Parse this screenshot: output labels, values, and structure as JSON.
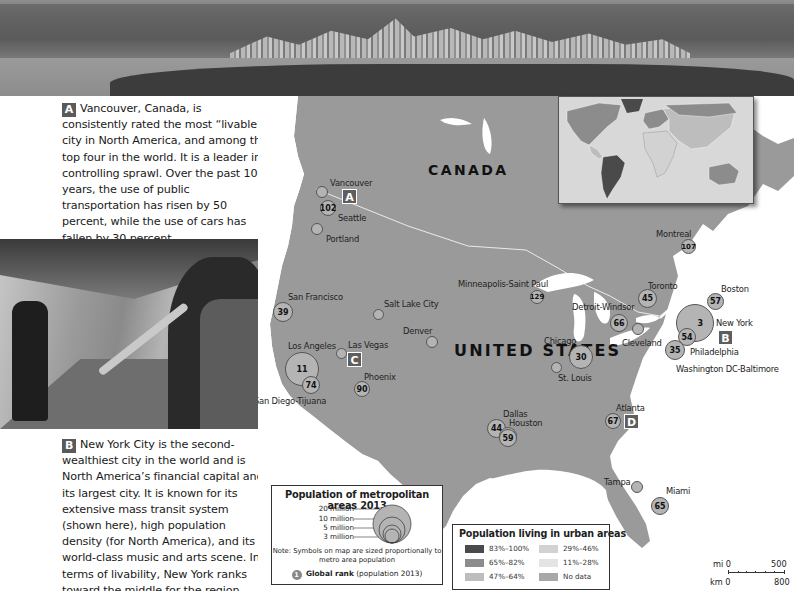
{
  "photos": {
    "top": {
      "subject": "Vancouver skyline"
    },
    "subway": {
      "subject": "Trumpet player in New York subway station"
    }
  },
  "captions": {
    "a": {
      "badge": "A",
      "text": "Vancouver, Canada, is consistently rated the most “livable” city in North America, and among the top four in the world. It is a leader in controlling sprawl. Over the past 10 years, the use of public transportation has risen by 50 percent, while the use of cars has fallen by 30 percent."
    },
    "b": {
      "badge": "B",
      "text": "New York City is the second-wealthiest city in the world and is North America’s financial capital and its largest city. It is known for its extensive mass transit system (shown here), high population density (for North America), and its world-class music and arts scene. In terms of livability, New York ranks toward the middle for the region."
    }
  },
  "map": {
    "countries": {
      "canada": "CANADA",
      "usa": "UNITED STATES"
    },
    "cities": [
      {
        "name": "Vancouver",
        "rank": ""
      },
      {
        "name": "Seattle",
        "rank": "102"
      },
      {
        "name": "Portland",
        "rank": ""
      },
      {
        "name": "San Francisco",
        "rank": "39"
      },
      {
        "name": "Salt Lake City",
        "rank": ""
      },
      {
        "name": "Los Angeles",
        "rank": "11"
      },
      {
        "name": "San Diego-Tijuana",
        "rank": "74"
      },
      {
        "name": "Las Vegas",
        "rank": ""
      },
      {
        "name": "Phoenix",
        "rank": "90"
      },
      {
        "name": "Denver",
        "rank": ""
      },
      {
        "name": "Minneapolis-Saint Paul",
        "rank": "129"
      },
      {
        "name": "Chicago",
        "rank": "30"
      },
      {
        "name": "Detroit-Windsor",
        "rank": "66"
      },
      {
        "name": "Toronto",
        "rank": "45"
      },
      {
        "name": "Cleveland",
        "rank": ""
      },
      {
        "name": "Montreal",
        "rank": "107"
      },
      {
        "name": "Boston",
        "rank": "57"
      },
      {
        "name": "New York",
        "rank": "3"
      },
      {
        "name": "Philadelphia",
        "rank": "54"
      },
      {
        "name": "Washington DC-Baltimore",
        "rank": "35"
      },
      {
        "name": "St. Louis",
        "rank": ""
      },
      {
        "name": "Dallas",
        "rank": "44"
      },
      {
        "name": "Houston",
        "rank": "59"
      },
      {
        "name": "Atlanta",
        "rank": "67"
      },
      {
        "name": "Tampa",
        "rank": ""
      },
      {
        "name": "Miami",
        "rank": "65"
      }
    ],
    "location_badges": {
      "a": "A",
      "b": "B",
      "c": "C",
      "d": "D"
    }
  },
  "legend_metro": {
    "title": "Population of metropolitan areas 2013",
    "sizes": [
      "20 million",
      "10 million",
      "5 million",
      "3 million"
    ],
    "note": "Note: Symbols on map are sized proportionally to metro area population",
    "rank_symbol": "1",
    "rank_label": "Global rank",
    "rank_suffix": "(population 2013)"
  },
  "legend_urban": {
    "title": "Population living in urban areas",
    "items": [
      {
        "label": "83%–100%",
        "color": "#4a4a4a"
      },
      {
        "label": "65%–82%",
        "color": "#8c8c8c"
      },
      {
        "label": "47%–64%",
        "color": "#bdbdbd"
      },
      {
        "label": "29%–46%",
        "color": "#d2d2d2"
      },
      {
        "label": "11%–28%",
        "color": "#e4e4e4"
      },
      {
        "label": "No data",
        "color": "#a8a8a8"
      }
    ]
  },
  "scale": {
    "mi_label": "mi 0",
    "mi_max": "500",
    "km_label": "km 0",
    "km_max": "800"
  },
  "colors": {
    "land": "#9a9a9a",
    "water": "#ffffff",
    "circle_fill": "#b4b4b4",
    "badge": "#5a5a5a"
  }
}
